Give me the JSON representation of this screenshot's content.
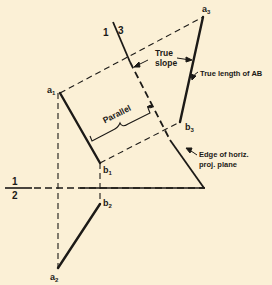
{
  "diagram": {
    "type": "descriptive-geometry auxiliary view",
    "background": "#fbf0d6",
    "ink": "#1c1a17",
    "points": {
      "a1": {
        "label": "a",
        "sub": "1",
        "x": 60,
        "y": 93
      },
      "b1": {
        "label": "b",
        "sub": "1",
        "x": 100,
        "y": 163
      },
      "a2": {
        "label": "a",
        "sub": "2",
        "x": 58,
        "y": 268
      },
      "b2": {
        "label": "b",
        "sub": "2",
        "x": 100,
        "y": 204
      },
      "a3": {
        "label": "a",
        "sub": "3",
        "x": 203,
        "y": 17
      },
      "b3": {
        "label": "b",
        "sub": "3",
        "x": 180,
        "y": 122
      }
    },
    "fold_lines": {
      "f12": {
        "top": "1",
        "bottom": "2"
      },
      "f13": {
        "left": "1",
        "right": "3"
      }
    },
    "annotations": {
      "parallel": "Parallel",
      "true_slope_1": "True",
      "true_slope_2": "slope",
      "true_length": "True length of AB",
      "edge_1": "Edge of horiz.",
      "edge_2": "proj. plane"
    }
  }
}
